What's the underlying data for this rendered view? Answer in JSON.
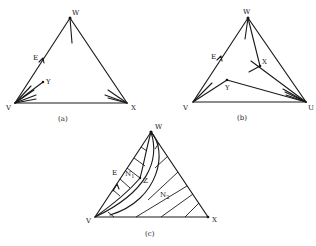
{
  "figure": {
    "panels": [
      {
        "id": "a",
        "caption": "(a)",
        "vertices": {
          "top": "W",
          "left": "V",
          "right": "X"
        },
        "points": {
          "edge_point": "E",
          "interior_point": "Y"
        }
      },
      {
        "id": "b",
        "caption": "(b)",
        "vertices": {
          "top": "W",
          "left": "V",
          "right": "U"
        },
        "points": {
          "edge_point": "E",
          "interior_point_1": "X",
          "interior_point_2": "Y"
        }
      },
      {
        "id": "c",
        "caption": "(c)",
        "vertices": {
          "top": "W",
          "left": "V",
          "right": "X"
        },
        "points": {
          "edge_point": "E",
          "interior_point": "Z"
        },
        "regions": {
          "n1": {
            "letter": "N",
            "sub": "1"
          },
          "n2": {
            "letter": "N",
            "sub": "2"
          }
        }
      }
    ]
  }
}
